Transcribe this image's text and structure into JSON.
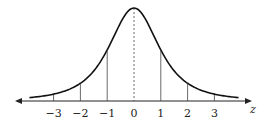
{
  "chart_data": {
    "type": "line",
    "title": "",
    "xlabel": "z",
    "ylabel": "",
    "x": [
      -3.9,
      -3,
      -2,
      -1,
      0,
      1,
      2,
      3,
      3.9
    ],
    "series": [
      {
        "name": "bell curve (standard normal-like density)",
        "values": [
          0.03,
          0.07,
          0.2,
          0.55,
          1.0,
          0.55,
          0.2,
          0.07,
          0.03
        ]
      }
    ],
    "x_ticks": [
      -3,
      -2,
      -1,
      0,
      1,
      2,
      3
    ],
    "tick_labels": [
      "−3",
      "−2",
      "−1",
      "0",
      "1",
      "2",
      "3"
    ],
    "xlim": [
      -4.5,
      4.5
    ],
    "grid": false,
    "annotations": [
      "Vertical lines at z = -2, -1, 1, 2 up to the curve",
      "Dashed vertical line at z = 0 (mean)",
      "Double-headed horizontal axis arrow"
    ]
  }
}
